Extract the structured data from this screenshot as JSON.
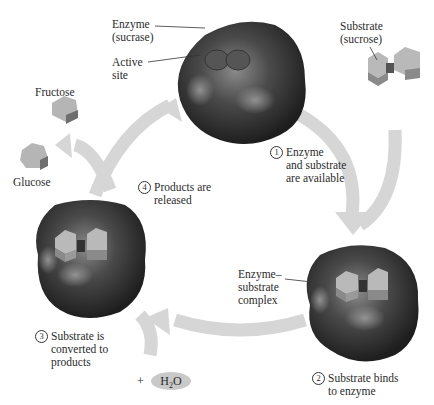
{
  "diagram": {
    "colors": {
      "enzyme_dark": "#2a2a2a",
      "enzyme_highlight": "#8a8a8a",
      "arrow": "#d6d6d6",
      "substrate_light": "#b9b9b9",
      "substrate_mid": "#9a9a9a",
      "substrate_dark": "#6e6e6e",
      "water_oval": "#c9c9c9"
    },
    "labels": {
      "enzyme": [
        "Enzyme",
        "(sucrase)"
      ],
      "active_site": [
        "Active",
        "site"
      ],
      "substrate": [
        "Substrate",
        "(sucrose)"
      ],
      "fructose": "Fructose",
      "glucose": "Glucose",
      "complex": [
        "Enzyme–",
        "substrate",
        "complex"
      ],
      "water_plus": "+",
      "water": "H2O"
    },
    "steps": [
      {
        "num": "1",
        "lines": [
          "Enzyme",
          "and substrate",
          "are available"
        ]
      },
      {
        "num": "2",
        "lines": [
          "Substrate binds",
          "to enzyme"
        ]
      },
      {
        "num": "3",
        "lines": [
          "Substrate is",
          "converted to",
          "products"
        ]
      },
      {
        "num": "4",
        "lines": [
          "Products are",
          "released"
        ]
      }
    ]
  }
}
